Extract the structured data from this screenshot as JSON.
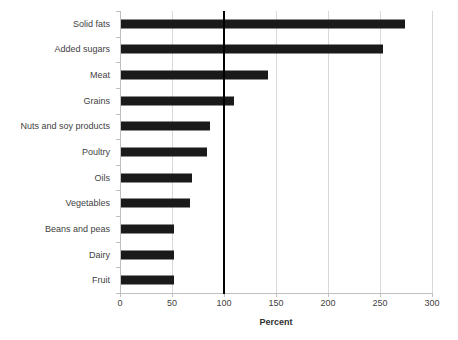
{
  "chart_data": {
    "type": "bar",
    "orientation": "horizontal",
    "title": "",
    "xlabel": "Percent",
    "ylabel": "",
    "xlim": [
      0,
      300
    ],
    "xticks": [
      0,
      50,
      100,
      150,
      200,
      250,
      300
    ],
    "xtick_labels": [
      "0",
      "50",
      "100",
      "150",
      "200",
      "250",
      "300"
    ],
    "grid": "vertical",
    "legend": "none",
    "bar_color": "#1a1a1a",
    "gridline_color": "#d9d9d9",
    "axis_color": "#bfbfbf",
    "reference_line": {
      "value": 100,
      "color": "#000000",
      "label": ""
    },
    "categories": [
      "Solid fats",
      "Added sugars",
      "Meat",
      "Grains",
      "Nuts and soy products",
      "Poultry",
      "Oils",
      "Vegetables",
      "Beans and peas",
      "Dairy",
      "Fruit"
    ],
    "values": [
      274,
      253,
      142,
      110,
      87,
      84,
      69,
      67,
      52,
      52,
      52
    ]
  }
}
